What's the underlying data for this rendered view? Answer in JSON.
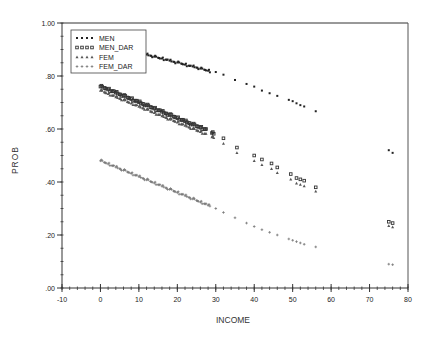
{
  "chart_data": {
    "type": "scatter",
    "title": "",
    "xlabel": "INCOME",
    "ylabel": "PROB",
    "xlim": [
      -10,
      80
    ],
    "ylim": [
      0,
      1
    ],
    "x_ticks": [
      -10,
      0,
      10,
      20,
      30,
      40,
      50,
      60,
      70,
      80
    ],
    "x_tick_labels": [
      "-10",
      "0",
      "10",
      "20",
      "30",
      "40",
      "50",
      "60",
      "70",
      "80"
    ],
    "y_ticks": [
      0,
      0.2,
      0.4,
      0.6,
      0.8,
      1.0
    ],
    "y_tick_labels": [
      ".00",
      ".20",
      ".40",
      ".60",
      ".80",
      "1.00"
    ],
    "grid": false,
    "legend_position": "top-left",
    "series": [
      {
        "name": "MEN",
        "marker": "dot",
        "color": "#222222",
        "x": [
          8,
          9,
          10,
          11,
          12,
          13,
          14,
          15,
          16,
          17,
          18,
          19,
          20,
          21,
          22,
          23,
          24,
          25,
          26,
          27,
          28,
          30,
          32,
          35,
          38,
          40,
          42,
          44,
          46,
          49,
          50,
          51,
          52,
          53,
          56,
          75,
          76
        ],
        "y": [
          0.895,
          0.892,
          0.888,
          0.884,
          0.881,
          0.877,
          0.873,
          0.869,
          0.866,
          0.862,
          0.858,
          0.854,
          0.851,
          0.847,
          0.843,
          0.839,
          0.836,
          0.832,
          0.828,
          0.824,
          0.82,
          0.815,
          0.805,
          0.785,
          0.77,
          0.76,
          0.745,
          0.735,
          0.725,
          0.71,
          0.705,
          0.697,
          0.69,
          0.685,
          0.667,
          0.52,
          0.51
        ]
      },
      {
        "name": "MEN_DAR",
        "marker": "square",
        "color": "#333333",
        "x": [
          0,
          1,
          2,
          3,
          4,
          5,
          6,
          7,
          8,
          9,
          10,
          11,
          12,
          13,
          14,
          15,
          16,
          17,
          18,
          19,
          20,
          21,
          22,
          23,
          24,
          25,
          26,
          27,
          29,
          32,
          35.5,
          40,
          42,
          44.5,
          46,
          49.5,
          51,
          52,
          53,
          56,
          75,
          76
        ],
        "y": [
          0.76,
          0.755,
          0.749,
          0.743,
          0.737,
          0.731,
          0.725,
          0.719,
          0.713,
          0.707,
          0.701,
          0.695,
          0.689,
          0.683,
          0.677,
          0.671,
          0.665,
          0.659,
          0.653,
          0.647,
          0.641,
          0.635,
          0.629,
          0.623,
          0.617,
          0.611,
          0.605,
          0.6,
          0.585,
          0.565,
          0.53,
          0.5,
          0.485,
          0.47,
          0.455,
          0.43,
          0.415,
          0.41,
          0.405,
          0.38,
          0.25,
          0.245
        ]
      },
      {
        "name": "FEM",
        "marker": "triangle",
        "color": "#555555",
        "x": [
          0,
          1,
          2,
          3,
          4,
          5,
          6,
          7,
          8,
          9,
          10,
          11,
          12,
          13,
          14,
          15,
          16,
          17,
          18,
          19,
          20,
          21,
          22,
          23,
          24,
          25,
          26,
          27,
          29,
          32,
          35.5,
          40,
          42,
          44.5,
          46,
          49.5,
          51,
          52,
          53,
          56,
          75,
          76
        ],
        "y": [
          0.745,
          0.739,
          0.733,
          0.727,
          0.721,
          0.715,
          0.709,
          0.703,
          0.697,
          0.691,
          0.685,
          0.679,
          0.673,
          0.667,
          0.661,
          0.655,
          0.649,
          0.643,
          0.637,
          0.631,
          0.625,
          0.619,
          0.613,
          0.607,
          0.601,
          0.595,
          0.589,
          0.583,
          0.57,
          0.545,
          0.51,
          0.48,
          0.465,
          0.45,
          0.435,
          0.41,
          0.395,
          0.39,
          0.385,
          0.365,
          0.235,
          0.23
        ]
      },
      {
        "name": "FEM_DAR",
        "marker": "plus",
        "color": "#777777",
        "x": [
          0,
          1,
          2,
          3,
          4,
          5,
          6,
          7,
          8,
          9,
          10,
          11,
          12,
          13,
          14,
          15,
          16,
          17,
          18,
          19,
          20,
          21,
          22,
          23,
          24,
          25,
          26,
          27,
          28,
          30,
          32,
          35,
          38,
          40,
          42,
          44,
          46,
          49,
          50,
          51,
          52,
          53,
          56,
          75,
          76
        ],
        "y": [
          0.48,
          0.474,
          0.468,
          0.462,
          0.456,
          0.45,
          0.444,
          0.438,
          0.432,
          0.426,
          0.42,
          0.414,
          0.408,
          0.402,
          0.396,
          0.39,
          0.384,
          0.378,
          0.372,
          0.366,
          0.36,
          0.354,
          0.348,
          0.342,
          0.336,
          0.33,
          0.324,
          0.318,
          0.312,
          0.3,
          0.285,
          0.265,
          0.245,
          0.232,
          0.22,
          0.21,
          0.2,
          0.185,
          0.18,
          0.175,
          0.17,
          0.165,
          0.155,
          0.09,
          0.088
        ]
      }
    ]
  }
}
